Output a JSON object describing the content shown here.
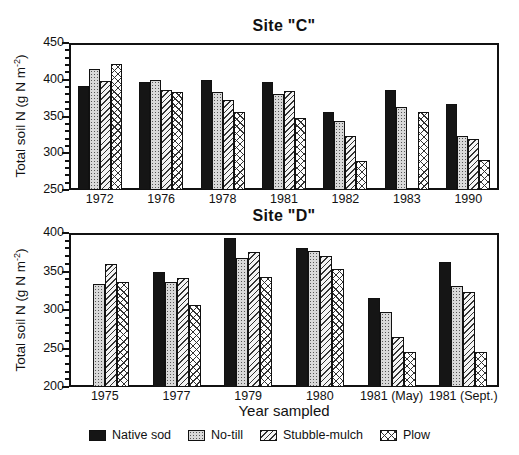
{
  "figure": {
    "background": "#ffffff",
    "ink": "#111111"
  },
  "chart_data": [
    {
      "type": "bar",
      "title": "Site \"C\"",
      "ylabel": {
        "text": "Total soil N (g N m⁻²)",
        "prefix": "Total soil N (g N m",
        "sup": "-2",
        "suffix": ")"
      },
      "xlabel": "",
      "ylim": [
        250,
        450
      ],
      "yticks": [
        250,
        300,
        350,
        400,
        450
      ],
      "ytick_minor": 10,
      "grid": false,
      "categories": [
        "1972",
        "1976",
        "1978",
        "1981",
        "1982",
        "1983",
        "1990"
      ],
      "series": [
        {
          "name": "Native sod",
          "values": [
            391,
            397,
            399,
            397,
            356,
            386,
            367
          ]
        },
        {
          "name": "No-till",
          "values": [
            415,
            400,
            383,
            380,
            344,
            363,
            323
          ]
        },
        {
          "name": "Stubble-mulch",
          "values": [
            398,
            386,
            372,
            385,
            323,
            null,
            319
          ]
        },
        {
          "name": "Plow",
          "values": [
            422,
            383,
            356,
            348,
            289,
            356,
            291
          ]
        }
      ]
    },
    {
      "type": "bar",
      "title": "Site \"D\"",
      "ylabel": {
        "text": "Total soil N (g N m⁻²)",
        "prefix": "Total soil N (g N m",
        "sup": "-2",
        "suffix": ")"
      },
      "xlabel": "Year sampled",
      "ylim": [
        200,
        400
      ],
      "yticks": [
        200,
        250,
        300,
        350,
        400
      ],
      "ytick_minor": 10,
      "grid": false,
      "categories": [
        "1975",
        "1977",
        "1979",
        "1980",
        "1981 (May)",
        "1981 (Sept.)"
      ],
      "series": [
        {
          "name": "Native sod",
          "values": [
            null,
            350,
            393,
            381,
            316,
            362
          ]
        },
        {
          "name": "No-till",
          "values": [
            334,
            336,
            368,
            376,
            297,
            331
          ]
        },
        {
          "name": "Stubble-mulch",
          "values": [
            360,
            341,
            375,
            370,
            265,
            323
          ]
        },
        {
          "name": "Plow",
          "values": [
            337,
            307,
            343,
            353,
            245,
            245
          ]
        }
      ]
    }
  ],
  "legend": {
    "entries": [
      {
        "label": "Native sod",
        "pattern": "solid"
      },
      {
        "label": "No-till",
        "pattern": "stipple"
      },
      {
        "label": "Stubble-mulch",
        "pattern": "diagonal"
      },
      {
        "label": "Plow",
        "pattern": "crosshatch"
      }
    ]
  }
}
